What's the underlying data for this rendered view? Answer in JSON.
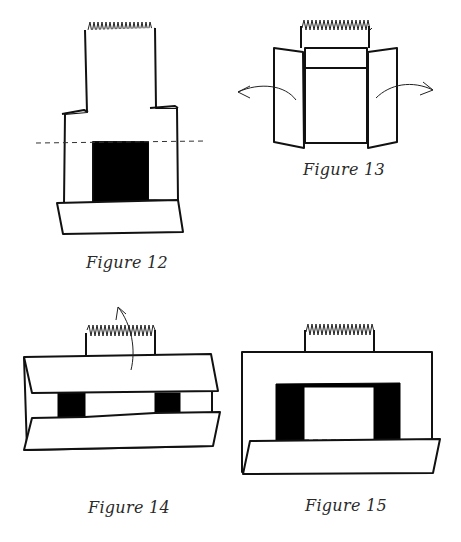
{
  "figures": [
    {
      "id": "figure-12",
      "caption": "Figure 12",
      "description": "Tall paper with spring top, side flaps folded in, black square center, dashed fold line, folded bottom flap"
    },
    {
      "id": "figure-13",
      "caption": "Figure 13",
      "description": "Paper with spring top and side flaps opening outward with curved arrows"
    },
    {
      "id": "figure-14",
      "caption": "Figure 14",
      "description": "Paper folded horizontally with two black rectangles visible, curved arrow indicating upward fold"
    },
    {
      "id": "figure-15",
      "caption": "Figure 15",
      "description": "Rectangle with spring top, black inverted-U shape with dashed bottom edge, folded bottom flap"
    }
  ],
  "colors": {
    "ink": "#111111",
    "fill_black": "#000000",
    "background": "#ffffff",
    "caption": "#2a2a2a"
  }
}
